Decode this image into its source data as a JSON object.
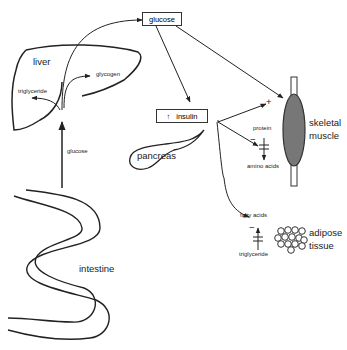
{
  "diagram": {
    "title": "",
    "nodes": {
      "glucose_box": "glucose",
      "liver": "liver",
      "glycogen": "glycogen",
      "liver_triglyceride": "triglyceride",
      "glucose_absorbed": "glucose",
      "insulin_box": "insulin",
      "insulin_arrow": "↑",
      "pancreas": "pancreas",
      "intestine": "intestine",
      "protein": "protein",
      "amino_acids": "amino acids",
      "skeletal_muscle_line1": "skeletal",
      "skeletal_muscle_line2": "muscle",
      "fatty_acids": "fatty acids",
      "adipose_triglyceride": "triglyceride",
      "adipose_line1": "adipose",
      "adipose_line2": "tissue",
      "plus_sign": "+",
      "minus_sign_protein": "−",
      "minus_sign_fat": "−"
    },
    "edges": [
      {
        "from": "intestine",
        "to": "liver",
        "label": "glucose"
      },
      {
        "from": "liver",
        "to": "glucose_box"
      },
      {
        "from": "liver",
        "to": "glycogen"
      },
      {
        "from": "liver",
        "to": "liver_triglyceride"
      },
      {
        "from": "glucose_box",
        "to": "insulin_box"
      },
      {
        "from": "glucose_box",
        "to": "skeletal_muscle"
      },
      {
        "from": "insulin",
        "to": "skeletal_muscle",
        "effect": "+"
      },
      {
        "from": "insulin",
        "to": "protein_breakdown",
        "effect": "−"
      },
      {
        "from": "insulin",
        "to": "lipolysis",
        "effect": "−"
      },
      {
        "from": "protein",
        "to": "amino_acids",
        "inhibited": true
      },
      {
        "from": "adipose_triglyceride",
        "to": "fatty_acids",
        "inhibited": true
      }
    ]
  }
}
